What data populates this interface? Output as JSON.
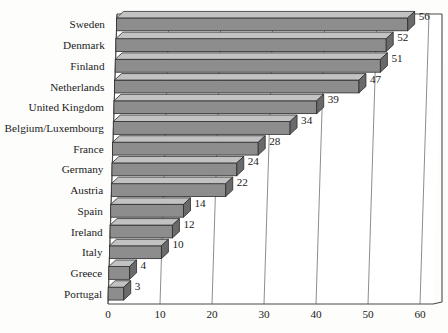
{
  "chart_data": {
    "type": "bar",
    "orientation": "horizontal",
    "style": "3d",
    "title": "",
    "xlabel": "",
    "ylabel": "",
    "xlim": [
      0,
      60
    ],
    "xticks": [
      "0",
      "10",
      "20",
      "30",
      "40",
      "50",
      "60"
    ],
    "grid": true,
    "legend": null,
    "categories": [
      "Sweden",
      "Denmark",
      "Finland",
      "Netherlands",
      "United Kingdom",
      "Belgium/Luxembourg",
      "France",
      "Germany",
      "Austria",
      "Spain",
      "Ireland",
      "Italy",
      "Greece",
      "Portugal"
    ],
    "values": [
      56,
      52,
      51,
      47,
      39,
      34,
      28,
      24,
      22,
      14,
      12,
      10,
      4,
      3
    ],
    "data_labels": [
      "56",
      "52",
      "51",
      "47",
      "39",
      "34",
      "28",
      "24",
      "22",
      "14",
      "12",
      "10",
      "4",
      "3"
    ],
    "colors": {
      "bar_front": "#8d8d8d",
      "bar_top": "#c2c2c2",
      "bar_side": "#6a6a6a",
      "bar_outline": "#2c2c2c",
      "gridline": "#6f6f6f",
      "frame": "#4a4a4a",
      "plot_background": "#ffffff",
      "page_background": "#fdfdfc",
      "text": "#1b1b1b"
    }
  }
}
